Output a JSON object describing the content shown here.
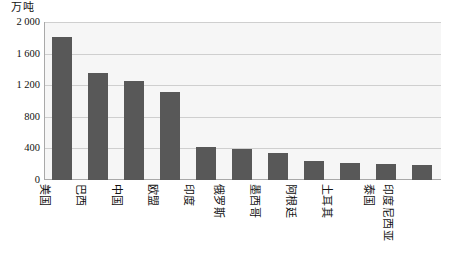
{
  "chart_data": {
    "type": "bar",
    "title": "",
    "subtitle": "",
    "xlabel": "",
    "ylabel": "万吨",
    "ylim": [
      0,
      2000
    ],
    "yticks": [
      0,
      400,
      800,
      1200,
      1600,
      2000
    ],
    "ytick_labels": [
      "0",
      "400",
      "800",
      "1 200",
      "1 600",
      "2 000"
    ],
    "grid": true,
    "legend": false,
    "legend_position": "none",
    "bar_color": "#585858",
    "plot_background": "#f6f6f6",
    "gridline_color": "#cfcfcf",
    "axis_color": "#a9a9a9",
    "categories": [
      "美国",
      "巴西",
      "中国",
      "欧盟",
      "印度",
      "俄罗斯",
      "墨西哥",
      "阿根廷",
      "土耳其",
      "泰国",
      "印度尼西亚"
    ],
    "values": [
      1810,
      1350,
      1250,
      1110,
      420,
      390,
      340,
      235,
      215,
      205,
      195
    ]
  }
}
